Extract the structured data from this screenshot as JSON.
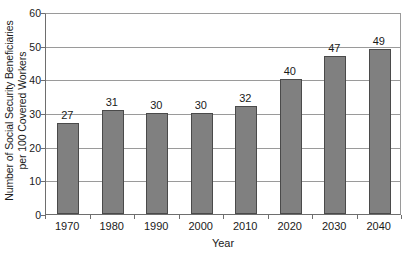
{
  "chart_data": {
    "type": "bar",
    "title": "",
    "xlabel": "Year",
    "ylabel": "Number of Social Security Beneficiaries per 100 Covered Workers",
    "ylabel_lines": [
      "Number of Social Security Beneficiaries",
      "per 100 Covered Workers"
    ],
    "categories": [
      "1970",
      "1980",
      "1990",
      "2000",
      "2010",
      "2020",
      "2030",
      "2040"
    ],
    "values": [
      27,
      31,
      30,
      30,
      32,
      40,
      47,
      49
    ],
    "data_labels": [
      "27",
      "31",
      "30",
      "30",
      "32",
      "40",
      "47",
      "49"
    ],
    "ylim": [
      0,
      60
    ],
    "ytick_labels": [
      "0",
      "10",
      "20",
      "30",
      "40",
      "50",
      "60"
    ],
    "ytick_values": [
      0,
      10,
      20,
      30,
      40,
      50,
      60
    ],
    "grid": true,
    "legend": false,
    "bar_color": "#808080",
    "bar_edge_color": "#4a4a4a",
    "grid_color": "#9a9a9a",
    "axis_color": "#6e6e6e",
    "background_color": "#ffffff"
  }
}
